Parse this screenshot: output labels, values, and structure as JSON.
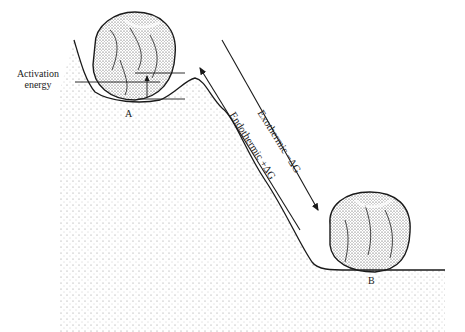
{
  "diagram": {
    "labels": {
      "activation_energy_line1": "Activation",
      "activation_energy_line2": "energy",
      "state_a": "A",
      "state_b": "B",
      "exothermic": "Exothermic −ΔG",
      "endothermic": "Endothermic +ΔG"
    },
    "arrows": [
      {
        "name": "exothermic-arrow",
        "direction": "down-right",
        "from": "A",
        "to": "B"
      },
      {
        "name": "endothermic-arrow",
        "direction": "up-left",
        "from": "B",
        "to": "A"
      }
    ],
    "colors": {
      "ink": "#1a1a1a",
      "background": "#ffffff",
      "stipple": "#555555"
    }
  }
}
